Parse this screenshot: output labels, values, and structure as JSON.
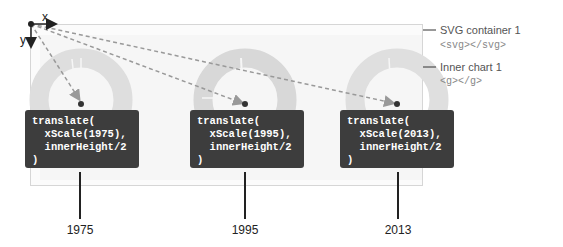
{
  "axes": {
    "x_label": "x",
    "y_label": "y"
  },
  "callouts": {
    "svg_container": {
      "title": "SVG container 1",
      "code": "<svg></svg>"
    },
    "inner_chart": {
      "title": "Inner chart 1",
      "code": "<g></g>"
    }
  },
  "charts": [
    {
      "year": "1975",
      "code_lines": [
        "translate(",
        "  xScale(1975),",
        "  innerHeight/2",
        ")"
      ]
    },
    {
      "year": "1995",
      "code_lines": [
        "translate(",
        "  xScale(1995),",
        "  innerHeight/2",
        ")"
      ]
    },
    {
      "year": "2013",
      "code_lines": [
        "translate(",
        "  xScale(2013),",
        "  innerHeight/2",
        ")"
      ]
    }
  ],
  "colors": {
    "donut": "#dcdcdc",
    "arrow": "#999999",
    "code_bg": "#3d3d3d",
    "tick": "#222222"
  }
}
